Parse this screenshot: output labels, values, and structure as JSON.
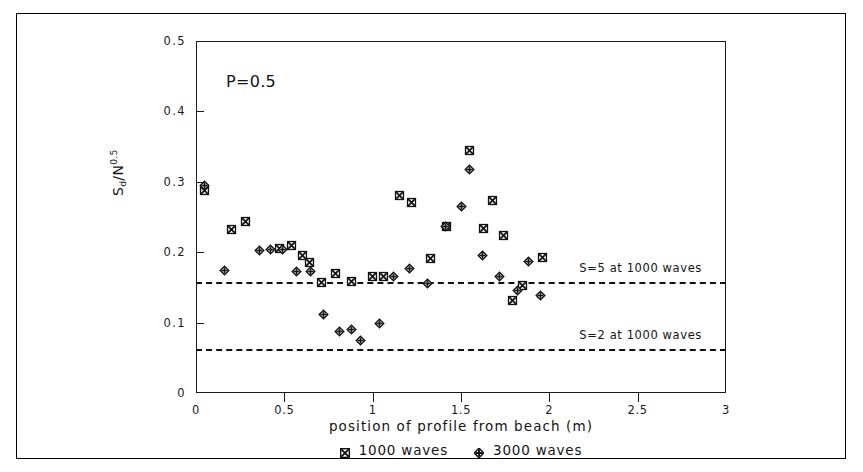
{
  "figure": {
    "panel_annotation": "P=0.5",
    "frame_color": "#000000"
  },
  "chart_data": {
    "type": "scatter",
    "title": "",
    "xlabel": "position of profile from beach (m)",
    "ylabel": "Sd/N0.5",
    "ylabel_parts": {
      "base": "S",
      "sub": "d",
      "divider": "/N",
      "sup": "0.5"
    },
    "xlim": [
      0,
      3
    ],
    "ylim": [
      0,
      0.5
    ],
    "xticks": [
      0,
      0.5,
      1,
      1.5,
      2,
      2.5,
      3
    ],
    "xticklabels": [
      "0",
      "0.5",
      "1",
      "1.5",
      "2",
      "2.5",
      "3"
    ],
    "yticks": [
      0,
      0.1,
      0.2,
      0.3,
      0.4,
      0.5
    ],
    "yticklabels": [
      "0",
      "0.1",
      "0.2",
      "0.3",
      "0.4",
      "0.5"
    ],
    "grid": false,
    "legend_position": "below-axes",
    "marker_color": "#111111",
    "series": [
      {
        "name": "1000 waves",
        "marker": "square-crossed",
        "points": [
          [
            0.05,
            0.288
          ],
          [
            0.2,
            0.232
          ],
          [
            0.28,
            0.243
          ],
          [
            0.47,
            0.205
          ],
          [
            0.54,
            0.21
          ],
          [
            0.6,
            0.195
          ],
          [
            0.64,
            0.185
          ],
          [
            0.71,
            0.157
          ],
          [
            0.79,
            0.17
          ],
          [
            0.88,
            0.159
          ],
          [
            1.0,
            0.166
          ],
          [
            1.06,
            0.166
          ],
          [
            1.15,
            0.28
          ],
          [
            1.22,
            0.27
          ],
          [
            1.33,
            0.191
          ],
          [
            1.42,
            0.237
          ],
          [
            1.55,
            0.345
          ],
          [
            1.63,
            0.233
          ],
          [
            1.68,
            0.274
          ],
          [
            1.74,
            0.224
          ],
          [
            1.79,
            0.131
          ],
          [
            1.85,
            0.152
          ],
          [
            1.96,
            0.192
          ]
        ]
      },
      {
        "name": "3000 waves",
        "marker": "diamond-crossed",
        "points": [
          [
            0.05,
            0.295
          ],
          [
            0.16,
            0.174
          ],
          [
            0.36,
            0.203
          ],
          [
            0.42,
            0.204
          ],
          [
            0.49,
            0.204
          ],
          [
            0.57,
            0.172
          ],
          [
            0.65,
            0.172
          ],
          [
            0.72,
            0.111
          ],
          [
            0.81,
            0.087
          ],
          [
            0.88,
            0.09
          ],
          [
            0.93,
            0.075
          ],
          [
            1.04,
            0.099
          ],
          [
            1.12,
            0.166
          ],
          [
            1.21,
            0.177
          ],
          [
            1.31,
            0.155
          ],
          [
            1.41,
            0.236
          ],
          [
            1.5,
            0.265
          ],
          [
            1.55,
            0.318
          ],
          [
            1.62,
            0.196
          ],
          [
            1.72,
            0.166
          ],
          [
            1.82,
            0.145
          ],
          [
            1.88,
            0.187
          ],
          [
            1.95,
            0.139
          ]
        ]
      }
    ],
    "reference_lines": [
      {
        "value": 0.158,
        "label": "S=5 at 1000 waves",
        "style": "dashed",
        "label_x": 2.17,
        "label_y": 0.178
      },
      {
        "value": 0.063,
        "label": "S=2 at 1000 waves",
        "style": "dashed",
        "label_x": 2.17,
        "label_y": 0.083
      }
    ]
  },
  "legend": {
    "entries": [
      {
        "label": "1000 waves",
        "marker": "square-crossed"
      },
      {
        "label": "3000 waves",
        "marker": "diamond-crossed"
      }
    ]
  }
}
